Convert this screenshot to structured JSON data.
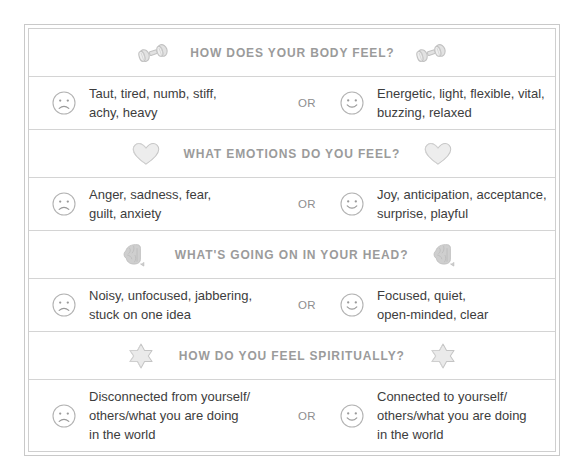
{
  "worksheet": {
    "title": "Body Check-In Worksheet",
    "or_label": "OR",
    "colors": {
      "header_text": "#9b9b9b",
      "body_text": "#3d3d3d",
      "border": "#cfcfcf",
      "icon": "#c0c0c0",
      "face_outline": "#b0b0b0"
    },
    "sections": [
      {
        "id": "body",
        "heading": "HOW DOES YOUR BODY FEEL?",
        "icon": "dumbbell-icon",
        "negative": "Taut, tired, numb, stiff,\nachy, heavy",
        "positive": "Energetic, light, flexible, vital,\nbuzzing, relaxed",
        "negative_face": "sad-face-icon",
        "positive_face": "happy-face-icon"
      },
      {
        "id": "emotions",
        "heading": "WHAT EMOTIONS DO YOU FEEL?",
        "icon": "heart-icon",
        "negative": "Anger, sadness, fear,\nguilt, anxiety",
        "positive": "Joy, anticipation, acceptance,\nsurprise, playful",
        "negative_face": "sad-face-icon",
        "positive_face": "happy-face-icon"
      },
      {
        "id": "head",
        "heading": "WHAT'S GOING ON IN YOUR HEAD?",
        "icon": "brain-icon",
        "negative": "Noisy, unfocused, jabbering,\nstuck on one idea",
        "positive": "Focused, quiet,\nopen-minded, clear",
        "negative_face": "sad-face-icon",
        "positive_face": "happy-face-icon"
      },
      {
        "id": "spirit",
        "heading": "HOW DO YOU FEEL SPIRITUALLY?",
        "icon": "star-icon",
        "negative": "Disconnected from yourself/\nothers/what you are doing\nin the world",
        "positive": "Connected to yourself/\nothers/what you are doing\nin the world",
        "negative_face": "sad-face-icon",
        "positive_face": "happy-face-icon"
      }
    ]
  }
}
